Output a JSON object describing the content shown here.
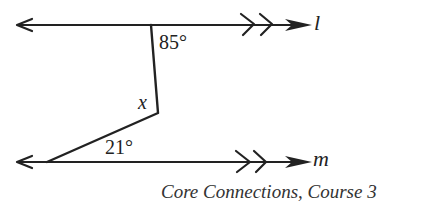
{
  "diagram": {
    "lines": [
      {
        "name": "l",
        "label": "l"
      },
      {
        "name": "m",
        "label": "m"
      }
    ],
    "angles": {
      "top": "85°",
      "bottom": "21°",
      "unknown": "x"
    },
    "parallel_marks": ">>",
    "stroke_color": "#222222"
  },
  "caption": "Core Connections, Course 3"
}
